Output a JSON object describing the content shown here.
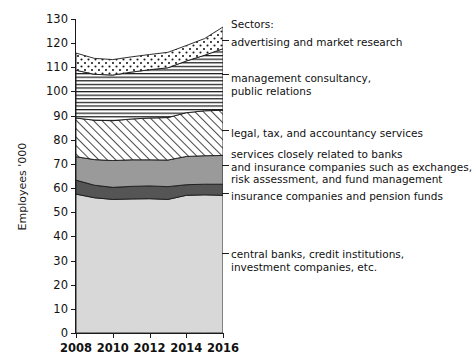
{
  "chart_data": {
    "type": "area",
    "title": "",
    "xlabel": "",
    "ylabel": "Employees '000",
    "xlim": [
      2008,
      2016
    ],
    "ylim": [
      0,
      130
    ],
    "grid": false,
    "stacked": true,
    "legend_position": "right",
    "legend_title": "Sectors:",
    "x": [
      2008,
      2009,
      2010,
      2011,
      2012,
      2013,
      2014,
      2015,
      2016
    ],
    "xticks": [
      "2008",
      "2010",
      "2012",
      "2014",
      "2016"
    ],
    "yticks": [
      "0",
      "10",
      "20",
      "30",
      "40",
      "50",
      "60",
      "70",
      "80",
      "90",
      "100",
      "110",
      "120",
      "130"
    ],
    "series": [
      {
        "name": "central banks, credit institutions, investment companies, etc.",
        "fill": "light-gray-solid",
        "color": "#d8d8d8",
        "values": [
          57.5,
          56.0,
          55.3,
          55.5,
          55.6,
          55.3,
          57.0,
          57.2,
          57.0
        ]
      },
      {
        "name": "insurance companies and pension funds",
        "fill": "dark-gray-solid",
        "color": "#555555",
        "values": [
          5.8,
          5.2,
          5.0,
          5.2,
          5.3,
          5.3,
          4.4,
          4.4,
          4.6
        ]
      },
      {
        "name": "services closely related to banks and insurance companies such as exchanges, risk assessment, and fund management",
        "fill": "medium-gray-solid",
        "color": "#9a9a9a",
        "values": [
          9.7,
          10.6,
          11.1,
          11.0,
          10.8,
          11.0,
          11.7,
          11.8,
          11.9
        ]
      },
      {
        "name": "legal, tax, and accountancy services",
        "fill": "diagonal-hatch",
        "color": "#ffffff",
        "values": [
          16.0,
          16.3,
          16.5,
          16.9,
          17.3,
          17.6,
          18.1,
          18.6,
          18.7
        ]
      },
      {
        "name": "management consultancy, public relations",
        "fill": "horizontal-lines",
        "color": "#ffffff",
        "values": [
          19.8,
          19.0,
          18.9,
          19.4,
          20.0,
          20.6,
          21.4,
          23.0,
          25.5
        ]
      },
      {
        "name": "advertising and market research",
        "fill": "dotted",
        "color": "#ffffff",
        "values": [
          7.1,
          6.6,
          6.4,
          6.3,
          6.3,
          6.4,
          6.4,
          6.9,
          9.0
        ]
      }
    ],
    "series_totals": [
      115.9,
      113.7,
      113.2,
      114.3,
      115.3,
      116.2,
      119.0,
      121.9,
      126.7
    ]
  },
  "legend": {
    "title": "Sectors:",
    "entries": [
      {
        "label": "advertising and market research",
        "lines": [
          "advertising and market research"
        ]
      },
      {
        "label": "management consultancy, public relations",
        "lines": [
          "management consultancy,",
          "public relations"
        ]
      },
      {
        "label": "legal, tax, and accountancy services",
        "lines": [
          "legal, tax, and accountancy services"
        ]
      },
      {
        "label": "services closely related to banks",
        "lines": [
          "services closely related to banks",
          "and insurance companies such as exchanges,",
          "risk assessment, and fund management"
        ]
      },
      {
        "label": "insurance companies and pension funds",
        "lines": [
          "insurance companies and pension funds"
        ]
      },
      {
        "label": "central banks, credit institutions, investment companies, etc.",
        "lines": [
          "central banks, credit institutions,",
          "investment companies, etc."
        ]
      }
    ]
  },
  "axis": {
    "y_title": "Employees '000"
  }
}
